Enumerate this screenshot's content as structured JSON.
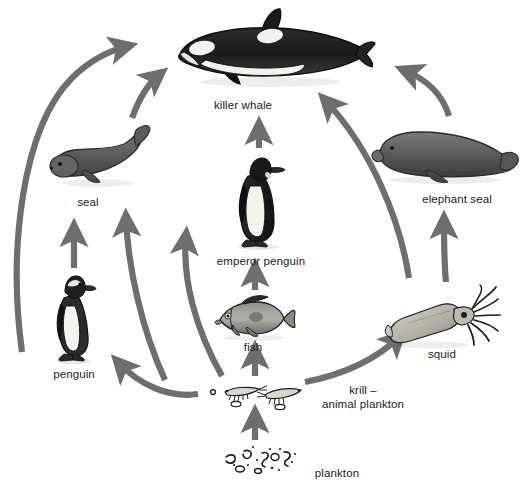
{
  "diagram": {
    "background_color": "#ffffff",
    "arrow_color": "#6e6e6e",
    "label_color": "#1b1b1b"
  },
  "nodes": [
    {
      "id": "killer-whale",
      "label": "killer whale",
      "label_x": 243,
      "label_y": 105,
      "art_x": 166,
      "art_y": 8,
      "art_w": 210,
      "art_h": 85
    },
    {
      "id": "seal",
      "label": "seal",
      "label_x": 88,
      "label_y": 202,
      "art_x": 46,
      "art_y": 124,
      "art_w": 105,
      "art_h": 68
    },
    {
      "id": "elephant-seal",
      "label": "elephant seal",
      "label_x": 457,
      "label_y": 199,
      "art_x": 370,
      "art_y": 120,
      "art_w": 150,
      "art_h": 70
    },
    {
      "id": "emperor-penguin",
      "label": "emperor penguin",
      "label_x": 261,
      "label_y": 261,
      "art_x": 228,
      "art_y": 152,
      "art_w": 64,
      "art_h": 98
    },
    {
      "id": "penguin",
      "label": "penguin",
      "label_x": 74,
      "label_y": 374,
      "art_x": 50,
      "art_y": 272,
      "art_w": 50,
      "art_h": 90
    },
    {
      "id": "fish",
      "label": "fish",
      "label_x": 253,
      "label_y": 347,
      "art_x": 212,
      "art_y": 294,
      "art_w": 84,
      "art_h": 48
    },
    {
      "id": "squid",
      "label": "squid",
      "label_x": 442,
      "label_y": 354,
      "art_x": 384,
      "art_y": 283,
      "art_w": 116,
      "art_h": 66
    },
    {
      "id": "krill",
      "label": "krill –\nanimal plankton",
      "label_x": 363,
      "label_y": 390,
      "art_x": 209,
      "art_y": 379,
      "art_w": 100,
      "art_h": 32
    },
    {
      "id": "plankton",
      "label": "plankton",
      "label_x": 337,
      "label_y": 473,
      "art_x": 222,
      "art_y": 443,
      "art_w": 80,
      "art_h": 36
    }
  ],
  "links": [
    {
      "id": "penguin-to-killer-whale",
      "from": "penguin",
      "to": "killer-whale",
      "shape": "long-left-arc"
    },
    {
      "id": "seal-to-killer-whale",
      "from": "seal",
      "to": "killer-whale",
      "shape": "short-arc"
    },
    {
      "id": "emperor-penguin-to-killer-whale",
      "from": "emperor-penguin",
      "to": "killer-whale",
      "shape": "straight-up"
    },
    {
      "id": "elephant-seal-to-killer-whale",
      "from": "elephant-seal",
      "to": "killer-whale",
      "shape": "right-arc"
    },
    {
      "id": "squid-to-killer-whale",
      "from": "squid",
      "to": "killer-whale",
      "shape": "long-right-arc"
    },
    {
      "id": "penguin-to-seal",
      "from": "penguin",
      "to": "seal",
      "shape": "straight-up"
    },
    {
      "id": "krill-to-seal",
      "from": "krill",
      "to": "seal",
      "shape": "arc-up-left"
    },
    {
      "id": "krill-to-penguin",
      "from": "krill",
      "to": "penguin",
      "shape": "arc-left"
    },
    {
      "id": "fish-to-emperor-penguin",
      "from": "fish",
      "to": "emperor-penguin",
      "shape": "straight-up"
    },
    {
      "id": "krill-to-fish",
      "from": "krill",
      "to": "fish",
      "shape": "straight-up"
    },
    {
      "id": "krill-to-squid",
      "from": "krill",
      "to": "squid",
      "shape": "arc-up-right"
    },
    {
      "id": "krill-to-emperor-penguin",
      "from": "krill",
      "to": "emperor-penguin",
      "shape": "arc-up"
    },
    {
      "id": "squid-to-elephant-seal",
      "from": "squid",
      "to": "elephant-seal",
      "shape": "arc-up"
    },
    {
      "id": "plankton-to-krill",
      "from": "plankton",
      "to": "krill",
      "shape": "straight-up"
    }
  ]
}
